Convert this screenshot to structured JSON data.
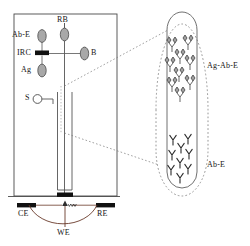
{
  "figure": {
    "type": "schematic-diagram",
    "stroke_color": "#3d3d3d",
    "fill_color": "#9a9a9a",
    "electrode_color": "#111111"
  },
  "cell_labels": {
    "ab_e": "Ab-E",
    "rb": "RB",
    "irc": "IRC",
    "b": "B",
    "ag": "Ag",
    "s": "S"
  },
  "electrode_labels": {
    "ce": "CE",
    "we": "WE",
    "re": "RE"
  },
  "callout_labels": {
    "complex": "Ag-Ab-E",
    "antibody": "Ab-E"
  },
  "callout_data": {
    "top_group_name": "Ag-Ab-E",
    "top_group_count": 9,
    "bottom_group_name": "Ab-E",
    "bottom_group_count": 9
  },
  "components": [
    {
      "key": "ab_e",
      "label": "Ab-E",
      "shape": "ellipse"
    },
    {
      "key": "rb",
      "label": "RB",
      "shape": "ellipse"
    },
    {
      "key": "irc",
      "label": "IRC",
      "shape": "bar"
    },
    {
      "key": "b",
      "label": "B",
      "shape": "ellipse"
    },
    {
      "key": "ag",
      "label": "Ag",
      "shape": "ellipse"
    },
    {
      "key": "s",
      "label": "S",
      "shape": "circle"
    }
  ]
}
